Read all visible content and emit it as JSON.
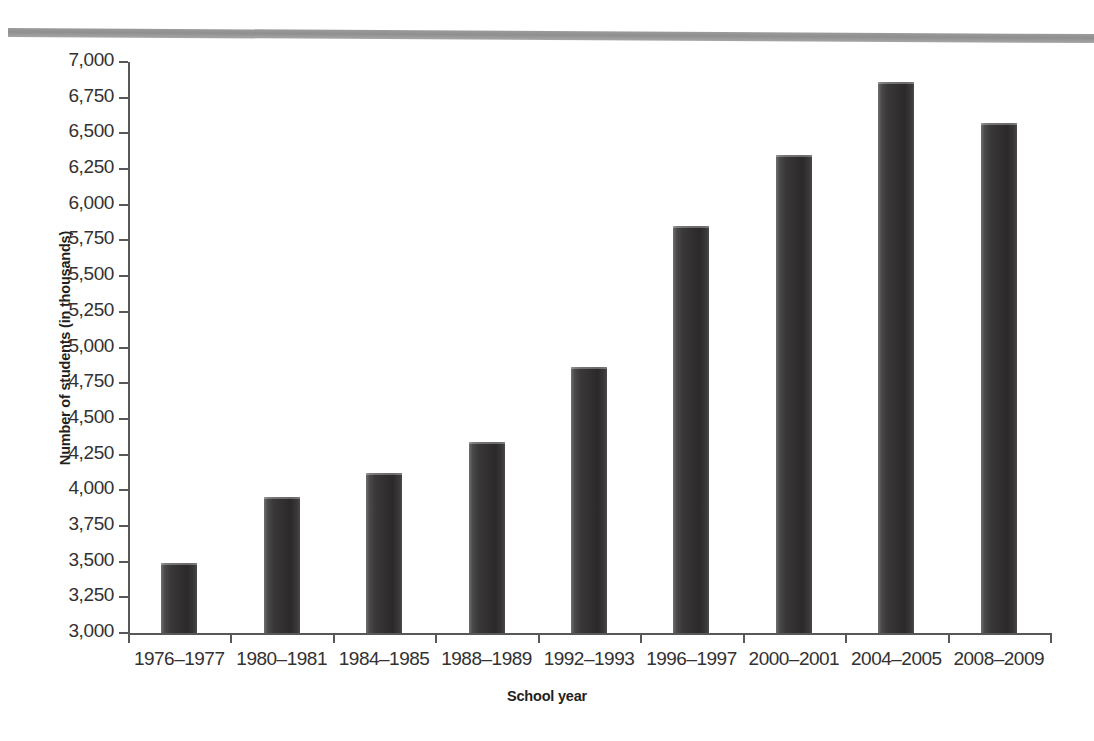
{
  "chart_data": {
    "type": "bar",
    "title": "",
    "subtitle": "",
    "xlabel": "School year",
    "ylabel": "Number of students (in thousands)",
    "categories": [
      "1976–1977",
      "1980–1981",
      "1984–1985",
      "1988–1989",
      "1992–1993",
      "1996–1997",
      "2000–2001",
      "2004–2005",
      "2008–2009"
    ],
    "values": [
      3490,
      3950,
      4120,
      4340,
      4865,
      5850,
      6350,
      6860,
      6570
    ],
    "ylim": [
      3000,
      7000
    ],
    "ytick_step": 250,
    "ytick_labels": [
      "7,000",
      "6,750",
      "6,500",
      "6,250",
      "6,000",
      "5,750",
      "5,500",
      "5,250",
      "5,000",
      "4,750",
      "4,500",
      "4,250",
      "4,000",
      "3,750",
      "3,500",
      "3,250",
      "3,000"
    ],
    "ytick_values": [
      7000,
      6750,
      6500,
      6250,
      6000,
      5750,
      5500,
      5250,
      5000,
      4750,
      4500,
      4250,
      4000,
      3750,
      3500,
      3250,
      3000
    ],
    "grid": false,
    "legend": null,
    "legend_position": "none",
    "series": [
      {
        "name": "Number of students (in thousands)",
        "values": [
          3490,
          3950,
          4120,
          4340,
          4865,
          5850,
          6350,
          6860,
          6570
        ]
      }
    ],
    "bar_color": "#332F30",
    "axis_color": "#58585A",
    "text_color": "#333132",
    "background_color": "#FFFFFF"
  },
  "decoration": {
    "top_rule_color": "#949494"
  }
}
